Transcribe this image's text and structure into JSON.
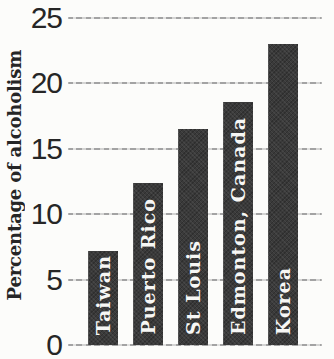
{
  "chart_data": {
    "type": "bar",
    "title": "",
    "ylabel": "Percentage of alcoholism",
    "xlabel": "",
    "categories": [
      "Taiwan",
      "Puerto Rico",
      "St Louis",
      "Edmonton, Canada",
      "Korea"
    ],
    "values": [
      7.2,
      12.4,
      16.5,
      18.6,
      23
    ],
    "yticks": [
      0,
      5,
      10,
      15,
      20,
      25
    ],
    "ylim": [
      0,
      25
    ],
    "grid": true,
    "legend": "none",
    "bar_labels_position": "inside-vertical",
    "colors": {
      "bar": "#3a3a3a",
      "bar_label": "#f7f7f5",
      "axis_text": "#262626",
      "gridline": "#a3a3a3",
      "background": "#fcfcfa"
    }
  }
}
